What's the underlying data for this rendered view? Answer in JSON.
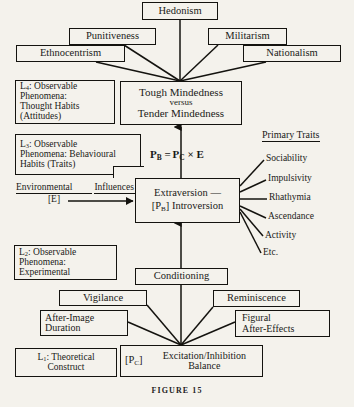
{
  "figure": {
    "caption": "FIGURE 15",
    "background_color": "#f4f2ec",
    "ink_color": "#14130f"
  },
  "nodes": {
    "hedonism": "Hedonism",
    "punitiveness": "Punitiveness",
    "militarism": "Militarism",
    "ethnocentrism": "Ethnocentrism",
    "nationalism": "Nationalism",
    "tough_tender_line1": "Tough Mindedness",
    "tough_tender_line2": "versus",
    "tough_tender_line3": "Tender Mindedness",
    "level4_line1": "L4: Observable",
    "level4_line2": "Phenomena:",
    "level4_line3": "Thought Habits",
    "level4_line4": "(Attitudes)",
    "level3_line1": "L3: Observable",
    "level3_line2": "Phenomena: Behavioural",
    "level3_line3": "Habits (Traits)",
    "level2_line1": "L2: Observable",
    "level2_line2": "Phenomena:",
    "level2_line3": "Experimental",
    "level1_line1": "L1: Theoretical",
    "level1_line2": "Construct",
    "extraversion_line1": "Extraversion —",
    "extraversion_line2_prefix": "[PB]",
    "extraversion_line2": "[PB] Introversion",
    "conditioning": "Conditioning",
    "vigilance": "Vigilance",
    "after_image_line1": "After-Image",
    "after_image_line2": "Duration",
    "reminiscence": "Reminiscence",
    "figural_line1": "Figural",
    "figural_line2": "After-Effects",
    "excitation_prefix": "[PC]",
    "excitation_line1": "Excitation/Inhibition",
    "excitation_line2": "Balance"
  },
  "labels": {
    "formula": "PB = PC × E",
    "environmental_line1": "Environmental",
    "environmental_line2": "Influences",
    "environmental_line3": "[E]",
    "primary_traits_header": "Primary Traits"
  },
  "primary_traits": [
    "Sociability",
    "Impulsivity",
    "Rhathymia",
    "Ascendance",
    "Activity",
    "Etc."
  ],
  "levels": {
    "l4_sub": "4",
    "l3_sub": "3",
    "l2_sub": "2",
    "l1_sub": "1"
  }
}
